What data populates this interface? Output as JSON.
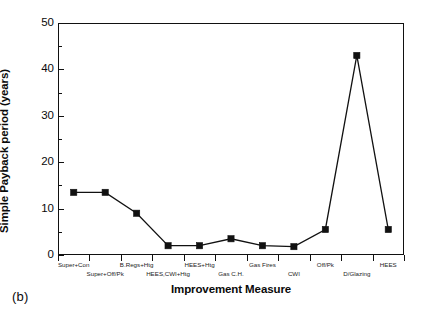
{
  "caption": "(b)",
  "chart_data": {
    "type": "line",
    "title": "",
    "xlabel": "Improvement Measure",
    "ylabel": "Simple Payback period (years)",
    "categories": [
      "Super+Con",
      "Super+Off/Pk",
      "B.Regs+Htg",
      "HEES,CWI+Htg",
      "HEES+Htg",
      "Gas C.H.",
      "Gas Fires",
      "CWI",
      "Off/Pk",
      "D/Glazing",
      "HEES"
    ],
    "values": [
      13.5,
      13.5,
      9.0,
      2.0,
      2.0,
      3.5,
      2.0,
      1.8,
      5.5,
      43.0,
      5.5
    ],
    "ylim": [
      0,
      50
    ],
    "y_ticks": [
      0,
      10,
      20,
      30,
      40,
      50
    ],
    "y_minor_ticks": [
      5,
      15,
      25,
      35,
      45
    ],
    "grid": false,
    "legend": "none",
    "marker": "filled-square",
    "line_color": "#111111",
    "marker_color": "#111111"
  }
}
